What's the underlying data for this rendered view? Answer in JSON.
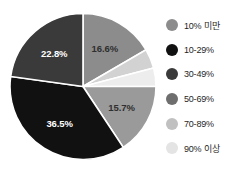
{
  "chart_data": {
    "type": "pie",
    "title": "",
    "subtitle": "",
    "xlabel": "",
    "ylabel": "",
    "grid": false,
    "legend_position": "right",
    "start_angle_deg": 0,
    "direction": "clockwise",
    "categories": [
      "10% 미만",
      "70-89%",
      "90% 이상",
      "50-69%",
      "10-29%",
      "30-49%"
    ],
    "values": [
      16.6,
      4.3,
      4.1,
      15.7,
      36.5,
      22.8
    ],
    "slices": [
      {
        "label": "10% 미만",
        "value": 16.6,
        "value_text": "16.6%",
        "color": "#8c8c8c",
        "label_shown": true,
        "label_color": "on-light"
      },
      {
        "label": "70-89%",
        "value": 4.3,
        "value_text": "",
        "color": "#d2d2d2",
        "label_shown": false,
        "label_color": "on-light"
      },
      {
        "label": "90% 이상",
        "value": 4.1,
        "value_text": "",
        "color": "#ededed",
        "label_shown": false,
        "label_color": "on-light"
      },
      {
        "label": "50-69%",
        "value": 15.7,
        "value_text": "15.7%",
        "color": "#9a9a9a",
        "label_shown": true,
        "label_color": "on-light"
      },
      {
        "label": "10-29%",
        "value": 36.5,
        "value_text": "36.5%",
        "color": "#111111",
        "label_shown": true,
        "label_color": "on-dark"
      },
      {
        "label": "30-49%",
        "value": 22.8,
        "value_text": "22.8%",
        "color": "#3a3a3a",
        "label_shown": true,
        "label_color": "on-dark"
      }
    ],
    "legend": [
      {
        "label": "10% 미만",
        "color": "#8c8c8c"
      },
      {
        "label": "10-29%",
        "color": "#111111"
      },
      {
        "label": "30-49%",
        "color": "#3a3a3a"
      },
      {
        "label": "50-69%",
        "color": "#6e6e6e"
      },
      {
        "label": "70-89%",
        "color": "#c0c0c0"
      },
      {
        "label": "90% 이상",
        "color": "#e4e4e4"
      }
    ]
  }
}
